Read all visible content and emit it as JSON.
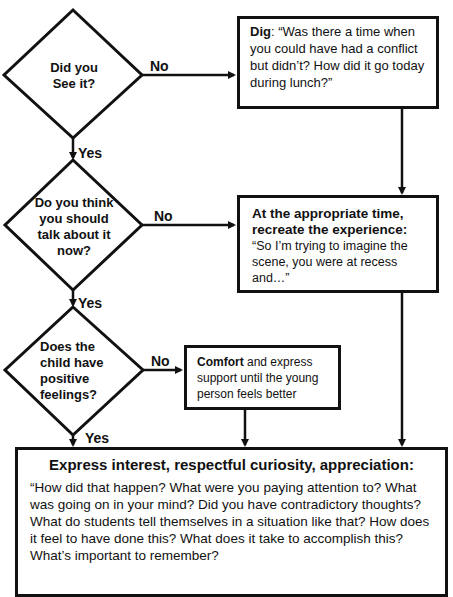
{
  "decisions": [
    {
      "text_lines": [
        "Did you",
        "See it?"
      ],
      "yes_label": "Yes",
      "no_label": "No"
    },
    {
      "text_lines": [
        "Do you think",
        "you should",
        "talk about it",
        "now?"
      ],
      "yes_label": "Yes",
      "no_label": "No"
    },
    {
      "text_lines": [
        "Does the",
        "child have",
        "positive",
        "feelings?"
      ],
      "yes_label": "Yes",
      "no_label": "No"
    }
  ],
  "boxes": {
    "dig": {
      "bold": "Dig",
      "text": ": “Was there a time when you could have had a conflict but didn’t?  How did it go today during lunch?”"
    },
    "recreate": {
      "heading": "At the appropriate time, recreate the experience:",
      "text": "“So I’m trying to imagine the scene, you were at recess and…”"
    },
    "comfort": {
      "bold": "Comfort",
      "text": " and express support until the young person feels better"
    },
    "express": {
      "heading": "Express interest, respectful curiosity, appreciation:",
      "text": "“How did that happen?  What were you paying attention to? What was going on in your mind? Did you have contradictory thoughts? What do students tell themselves in a situation like that?  How does it feel to have done this? What does it take to accomplish this?  What’s important to remember?"
    }
  },
  "colors": {
    "stroke": "#111111",
    "background": "#ffffff"
  }
}
